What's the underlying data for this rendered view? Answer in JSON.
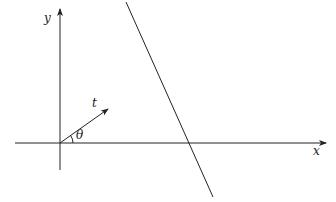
{
  "diagram": {
    "type": "geometry",
    "labels": {
      "y_axis": "y",
      "x_axis": "x",
      "vector": "t",
      "angle": "θ"
    },
    "colors": {
      "stroke": "#222222",
      "background": "#ffffff"
    },
    "elements": {
      "origin": [
        60,
        143
      ],
      "x_axis": {
        "from": [
          15,
          143
        ],
        "to": [
          326,
          143
        ]
      },
      "y_axis": {
        "from": [
          60,
          170
        ],
        "to": [
          60,
          8
        ]
      },
      "vector_t": {
        "from": [
          60,
          143
        ],
        "to": [
          108,
          109
        ]
      },
      "line": {
        "from": [
          126,
          2
        ],
        "to": [
          213,
          197
        ]
      },
      "angle_arc_radius": 13
    }
  }
}
